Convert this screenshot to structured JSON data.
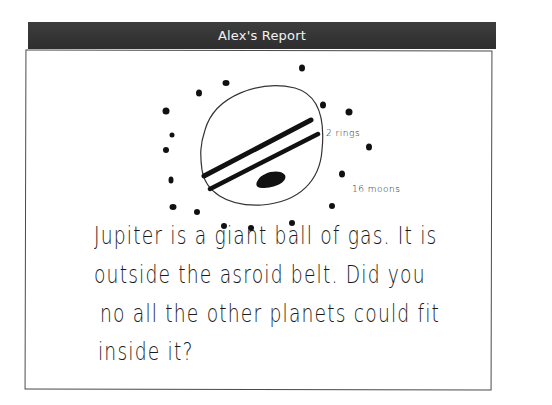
{
  "header": {
    "title": "Alex's Report"
  },
  "drawing": {
    "subject": "Jupiter",
    "labels": {
      "rings": "2 rings",
      "moons": "16 moons"
    },
    "moon_count_drawn": 16
  },
  "text": {
    "lines": [
      "Jupiter is a  giant ball of gas.  It is",
      "outside  the  asroid  belt.  Did  you",
      "no  all  the other planets  could fit",
      "inside it?"
    ]
  },
  "colors": {
    "header_bg": "#333333",
    "header_text": "#f2f2f2",
    "ink": "#111111",
    "border": "#4a4a4a"
  }
}
